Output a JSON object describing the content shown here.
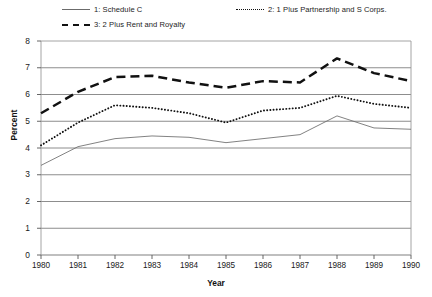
{
  "chart_data": {
    "type": "line",
    "title": "",
    "xlabel": "Year",
    "ylabel": "Percent",
    "x": [
      1980,
      1981,
      1982,
      1983,
      1984,
      1985,
      1986,
      1987,
      1988,
      1989,
      1990
    ],
    "xtick_labels": [
      "1980",
      "1981",
      "1982",
      "1983",
      "1984",
      "1985",
      "1986",
      "1987",
      "1988",
      "1989",
      "1990"
    ],
    "ytick_labels": [
      "0",
      "1",
      "2",
      "3",
      "4",
      "5",
      "6",
      "7",
      "8"
    ],
    "yticks": [
      0,
      1,
      2,
      3,
      4,
      5,
      6,
      7,
      8
    ],
    "ylim": [
      0,
      8
    ],
    "xlim": [
      1980,
      1990
    ],
    "grid": "horizontal",
    "legend_position": "above-plot",
    "series": [
      {
        "name": "1: Schedule C",
        "style": "solid-thin",
        "color": "#6b6b6b",
        "values": [
          3.35,
          4.05,
          4.35,
          4.45,
          4.4,
          4.2,
          4.35,
          4.5,
          5.2,
          4.75,
          4.7
        ]
      },
      {
        "name": "2: 1 Plus Partnership and S Corps.",
        "style": "dotted",
        "color": "#111111",
        "values": [
          4.1,
          4.95,
          5.6,
          5.5,
          5.3,
          4.95,
          5.4,
          5.5,
          5.95,
          5.65,
          5.5
        ]
      },
      {
        "name": "3: 2 Plus Rent and Royalty",
        "style": "dashed-thick",
        "color": "#111111",
        "values": [
          5.3,
          6.1,
          6.65,
          6.7,
          6.45,
          6.25,
          6.5,
          6.45,
          7.35,
          6.8,
          6.5
        ]
      }
    ]
  },
  "legend": {
    "entries": [
      {
        "label": "1: Schedule C"
      },
      {
        "label": "2: 1 Plus Partnership and S Corps."
      },
      {
        "label": "3: 2 Plus Rent and Royalty"
      }
    ]
  },
  "axes": {
    "y_title": "Percent",
    "x_title": "Year"
  }
}
